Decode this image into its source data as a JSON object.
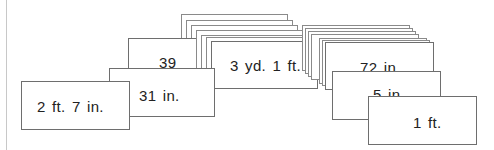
{
  "cards": [
    {
      "label": "3 yd. 1 ft.",
      "role": "stack-left-top"
    },
    {
      "label": "39 in.",
      "role": "card-39-in"
    },
    {
      "label": "31 in.",
      "role": "card-31-in"
    },
    {
      "label": "2 ft. 7 in.",
      "role": "card-2ft-7in"
    },
    {
      "label": "72 in.",
      "role": "card-72-in"
    },
    {
      "label": "5 in.",
      "role": "card-5-in"
    },
    {
      "label": "1 ft.",
      "role": "card-1-ft"
    }
  ],
  "stack_left": {
    "front_label": "3 yd. 1 ft."
  },
  "stack_right": {
    "front_label": "72 in."
  },
  "front_labels": {
    "card_39": "39",
    "card_31": "31 in.",
    "card_2ft7in": "2 ft. 7 in.",
    "card_3yd1ft": "3 yd. 1 ft.",
    "card_72": "72 in.",
    "card_5": "5 in",
    "card_1ft": "1 ft."
  }
}
